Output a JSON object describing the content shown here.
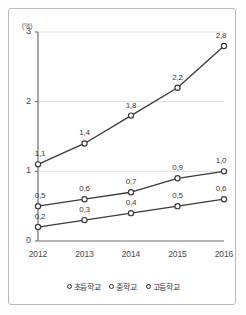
{
  "chart_data": {
    "type": "line",
    "title": "",
    "xlabel": "",
    "ylabel": "(%)",
    "unit_label": "(%)",
    "categories": [
      "2012",
      "2013",
      "2014",
      "2015",
      "2016"
    ],
    "ylim": [
      0,
      3
    ],
    "yticks": [
      "0",
      "1",
      "2",
      "3"
    ],
    "ytick_values": [
      0,
      1,
      2,
      3
    ],
    "grid": "horizontal",
    "legend_position": "bottom",
    "decimal_separator": ",",
    "series": [
      {
        "name": "초등학교",
        "values": [
          0.2,
          0.3,
          0.4,
          0.5,
          0.6
        ],
        "labels": [
          "0,2",
          "0,3",
          "0,4",
          "0,5",
          "0,6"
        ],
        "marker": "open-circle",
        "color": "#3a3a3a"
      },
      {
        "name": "중학교",
        "values": [
          0.5,
          0.6,
          0.7,
          0.9,
          1.0
        ],
        "labels": [
          "0,5",
          "0,6",
          "0,7",
          "0,9",
          "1,0"
        ],
        "marker": "open-circle",
        "color": "#3a3a3a"
      },
      {
        "name": "고등학교",
        "values": [
          1.1,
          1.4,
          1.8,
          2.2,
          2.8
        ],
        "labels": [
          "1,1",
          "1,4",
          "1,8",
          "2,2",
          "2,8"
        ],
        "marker": "open-circle",
        "color": "#3a3a3a"
      }
    ]
  },
  "legend": {
    "items": [
      {
        "label": "초등학교"
      },
      {
        "label": "중학교"
      },
      {
        "label": "고등학교"
      }
    ]
  },
  "colors": {
    "line": "#3a3a3a",
    "grid": "#dedede",
    "axis": "#6e6e6e",
    "text": "#3b3b3b",
    "border": "#b9b9b9"
  }
}
